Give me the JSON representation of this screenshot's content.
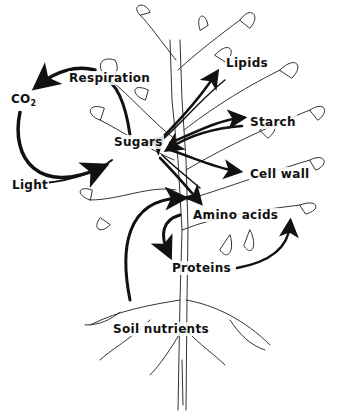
{
  "diagram": {
    "nodes": [
      {
        "id": "co2",
        "label": "CO",
        "subscript": "2"
      },
      {
        "id": "respiration",
        "label": "Respiration"
      },
      {
        "id": "sugars",
        "label": "Sugars"
      },
      {
        "id": "light",
        "label": "Light"
      },
      {
        "id": "lipids",
        "label": "Lipids"
      },
      {
        "id": "starch",
        "label": "Starch"
      },
      {
        "id": "cell_wall",
        "label": "Cell wall"
      },
      {
        "id": "amino_acids",
        "label": "Amino acids"
      },
      {
        "id": "proteins",
        "label": "Proteins"
      },
      {
        "id": "soil_nutrients",
        "label": "Soil nutrients"
      }
    ],
    "edges": [
      {
        "from": "sugars",
        "to": "co2",
        "via": "respiration"
      },
      {
        "from": "co2",
        "to": "sugars",
        "via": "light"
      },
      {
        "from": "sugars",
        "to": "lipids",
        "bidirectional": true
      },
      {
        "from": "sugars",
        "to": "starch",
        "bidirectional": true
      },
      {
        "from": "sugars",
        "to": "cell_wall"
      },
      {
        "from": "sugars",
        "to": "amino_acids",
        "bidirectional": true
      },
      {
        "from": "soil_nutrients",
        "to": "amino_acids"
      },
      {
        "from": "amino_acids",
        "to": "proteins"
      },
      {
        "from": "proteins",
        "to": "amino_acids"
      }
    ],
    "colors": {
      "ink": "#111111",
      "background": "#ffffff"
    }
  }
}
